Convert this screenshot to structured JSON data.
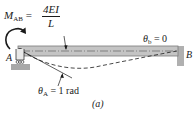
{
  "figure": {
    "moment_label": {
      "symbol": "M",
      "subscript": "AB",
      "equals": "=",
      "numerator": "4EI",
      "denominator": "L"
    },
    "theta_b_label": {
      "symbol": "θ",
      "subscript": "b",
      "value": "= 0"
    },
    "theta_a_label": {
      "symbol": "θ",
      "subscript": "A",
      "value": "= 1 rad"
    },
    "point_a": "A",
    "point_b": "B",
    "caption": "(a)",
    "colors": {
      "beam_fill": "#b9b9b9",
      "beam_edge": "#7a7a7a",
      "ground": "#a8a8a8",
      "ink": "#1a1a1a"
    }
  }
}
